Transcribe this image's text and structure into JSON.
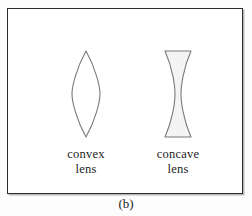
{
  "figure": {
    "panel_letter": "(b)",
    "frame_border_color": "#2b2b2b",
    "background_color": "#ffffff",
    "page_background_color": "#fdfdfd"
  },
  "lenses": [
    {
      "id": "convex",
      "type": "biconvex",
      "caption_line1": "convex",
      "caption_line2": "lens",
      "outline_color": "#7a7a7a",
      "fill_color": "#ffffff",
      "width_px": 29,
      "height_px": 84
    },
    {
      "id": "concave",
      "type": "biconcave",
      "caption_line1": "concave",
      "caption_line2": "lens",
      "outline_color": "#7a7a7a",
      "fill_color": "#f4f4f4",
      "width_px": 27,
      "height_px": 83
    }
  ]
}
